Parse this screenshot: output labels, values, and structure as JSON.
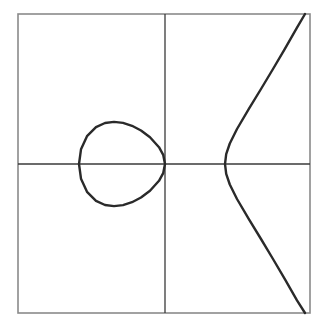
{
  "figure": {
    "title": "Real points of an elliptic curve",
    "frame": {
      "x": 18,
      "y": 14,
      "width": 292,
      "height": 299
    },
    "axes": {
      "x_axis_y": 164,
      "y_axis_x": 165
    },
    "colors": {
      "curve": "#2a2a2a",
      "axes": "#3a3a3a",
      "frame": "#8a8a8a",
      "background": "#ffffff"
    },
    "curve": {
      "equation": "y^2 = x(x+1.43)(x-1)",
      "real_roots_px": [
        79,
        165,
        225
      ],
      "oval_path": "M79,164 L81,149.3 L87,136.2 L96,127.2 L105,123 L114,121.9 L123,122.9 L132,125.8 L141,130.5 L150,137.2 L159,147.2 L163.2,154.8 L165,164 L163.2,173.2 L159,180.8 L150,190.8 L141,197.5 L132,202.2 L123,205.1 L114,206.1 L105,205 L96,200.8 L87,191.8 L81,178.7 Z",
      "branch_path": "M305,14 L297,27.7 L285,48.7 L273,69 L261,89 L249,108.6 L237,129 L229.8,143.5 L226.2,154.1 L225,164 L226.2,173.9 L229.8,184.5 L237,199 L249,219.4 L261,239 L273,259 L285,279.3 L297,300.3 L305,313"
    }
  }
}
